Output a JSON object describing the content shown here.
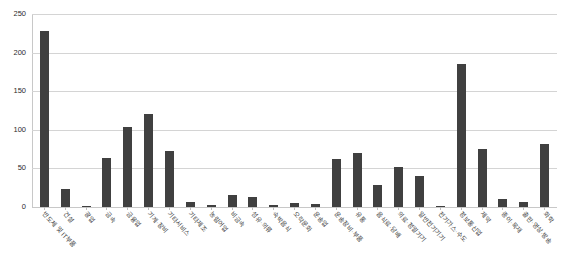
{
  "chart_data": {
    "type": "bar",
    "title": "",
    "xlabel": "",
    "ylabel": "",
    "ylim": [
      0,
      250
    ],
    "yticks": [
      0,
      50,
      100,
      150,
      200,
      250
    ],
    "grid": true,
    "legend": "none",
    "bar_color": "#404040",
    "gridline_color": "#d4d4d4",
    "categories": [
      "반도체 및 IT부품",
      "건설",
      "광업",
      "금속",
      "금융업",
      "기계·장비",
      "기타서비스",
      "기타제조",
      "농림어업",
      "비금속",
      "섬유·의류",
      "숙박음식",
      "오락문화",
      "운송업",
      "운송장비·부품",
      "유통",
      "음식료·담배",
      "의료·정밀기기",
      "일반전기기기",
      "전기가스·수도",
      "정보통신업",
      "제약",
      "종이·목재",
      "출판·영상·방송",
      "화학"
    ],
    "values": [
      228,
      23,
      1,
      64,
      103,
      120,
      73,
      7,
      2,
      15,
      13,
      2,
      5,
      4,
      62,
      70,
      28,
      52,
      40,
      1,
      185,
      75,
      11,
      6,
      82
    ]
  }
}
